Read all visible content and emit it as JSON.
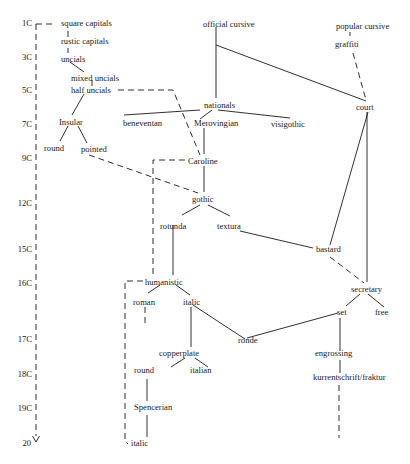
{
  "timeline": {
    "labels": [
      "1C",
      "3C",
      "5C",
      "7C",
      "9C",
      "12C",
      "15C",
      "16C",
      "17C",
      "18C",
      "19C",
      "20"
    ],
    "arrow": "down-arrow"
  },
  "nodes": {
    "square_capitals": "square capitals",
    "rustic_capitals": "rustic capitals",
    "uncials": "uncials",
    "mixed_uncials": "mixed uncials",
    "half_uncials": "half uncials",
    "insular": "Insular",
    "round_insular": "round",
    "pointed": "pointed",
    "official_cursive": "official cursive",
    "popular_cursive": "popular cursive",
    "graffiti": "graffiti",
    "nationals": "nationals",
    "court": "court",
    "beneventan": "beneventan",
    "merovingian": "Merovingian",
    "visigothic": "visigothic",
    "caroline": "Caroline",
    "gothic": "gothic",
    "rotunda": "rotunda",
    "textura": "textura",
    "bastard": "bastard",
    "humanistic": "humanistic",
    "secretary": "secretary",
    "roman": "roman",
    "italic": "italic",
    "set": "set",
    "free": "free",
    "ronde": "ronde",
    "copperplate": "copperplate",
    "engrossing": "engrossing",
    "round_copperplate": "round",
    "italian": "italian",
    "kurrentschrift": "kurrentschrift/fraktur",
    "spencerian": "Spencerian",
    "italic_modern": "italic"
  }
}
